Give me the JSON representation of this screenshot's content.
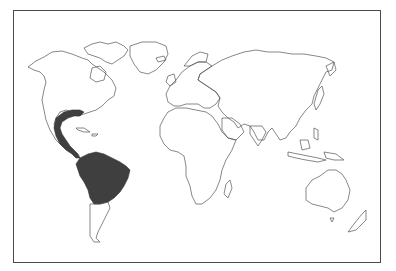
{
  "map": {
    "title": "World map — highlighted range",
    "projection": "equirectangular-world",
    "highlight_color": "#3f3f3f",
    "outline_color": "#555555",
    "frame_color": "#4a4a4a",
    "background_color": "#ffffff",
    "highlighted_regions": [
      "Gulf coast of United States",
      "Eastern & southern Mexico",
      "Central America",
      "Northern & central South America (Colombia, Venezuela, Guianas, Ecuador, Peru, Bolivia, Brazil, Paraguay)"
    ],
    "landmasses": [
      "North America",
      "Greenland",
      "South America",
      "Europe",
      "Africa",
      "Asia",
      "Australia",
      "New Zealand",
      "Madagascar",
      "Indonesia",
      "Japan"
    ]
  }
}
